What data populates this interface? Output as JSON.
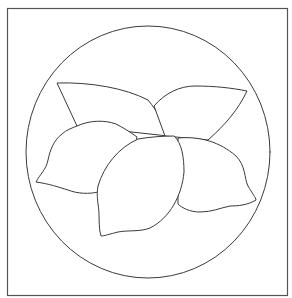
{
  "artwork": {
    "stroke_color": "#3a3a3a",
    "frame_color": "#555555",
    "background_color": "#ffffff",
    "elements": [
      "frame",
      "circle",
      "leaf-left",
      "leaf-right",
      "lemon-left",
      "lemon-right",
      "lemon-center"
    ]
  }
}
